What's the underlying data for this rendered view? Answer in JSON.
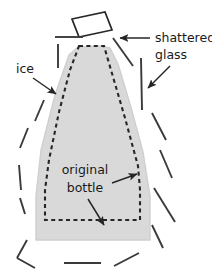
{
  "figure": {
    "background_color": "#ffffff",
    "width": 212,
    "height": 274
  },
  "colors": {
    "ice_fill": "#d9d9d9",
    "ice_edge": "#cfcfcf",
    "stroke": "#262626",
    "text": "#1a1a1a",
    "shard_stroke": "#3a3a3a"
  },
  "labels": {
    "ice": {
      "text": "ice",
      "x": 16,
      "y": 73
    },
    "shattered_glass": {
      "line1": "shattered",
      "line2": "glass",
      "x": 155,
      "y1": 42,
      "y2": 59
    },
    "original_bottle": {
      "line1": "original",
      "line2": "bottle",
      "x": 85,
      "y1": 174,
      "y2": 192
    }
  },
  "shapes": {
    "ice_block": {
      "name": "ice-block-silhouette",
      "path": "M 100 46 L 78 47 L 69 55 L 55 95 L 41 150 L 36 196 L 36 240 L 150 240 L 150 196 L 143 152 L 130 104 L 118 64 L 110 48 Z"
    },
    "original_bottle_outline": {
      "name": "original-bottle-dashed-outline",
      "path": "M 79 46 L 104 46 L 111 70 L 125 118 L 138 166 L 140 190 L 140 220 L 45 220 L 45 190 L 49 160 L 59 112 L 70 70 Z",
      "dash": "4,3.4"
    },
    "detached_neck": {
      "name": "detached-bottle-neck",
      "path": "M 72 19 L 105 12 L 112 30 L 79 37 Z"
    }
  },
  "glass_shards": [
    {
      "name": "shard-top-left-horizontal",
      "x1": 55,
      "y1": 37,
      "x2": 83,
      "y2": 37
    },
    {
      "name": "shard-upper-left-vertical",
      "x1": 58,
      "y1": 44,
      "x2": 58,
      "y2": 68
    },
    {
      "name": "shard-upper-right-diagonal",
      "x1": 113,
      "y1": 38,
      "x2": 133,
      "y2": 66
    },
    {
      "name": "shard-right-vertical",
      "x1": 141,
      "y1": 58,
      "x2": 142,
      "y2": 110
    },
    {
      "name": "shard-left-upper-diagonal",
      "x1": 44,
      "y1": 100,
      "x2": 35,
      "y2": 121
    },
    {
      "name": "shard-left-mid-diagonal",
      "x1": 28,
      "y1": 128,
      "x2": 20,
      "y2": 148
    },
    {
      "name": "shard-left-lower-vertical",
      "x1": 19,
      "y1": 165,
      "x2": 21,
      "y2": 190
    },
    {
      "name": "shard-left-bottom-short",
      "x1": 20,
      "y1": 198,
      "x2": 25,
      "y2": 214
    },
    {
      "name": "shard-right-upper-diagonal",
      "x1": 152,
      "y1": 113,
      "x2": 166,
      "y2": 140
    },
    {
      "name": "shard-right-mid-diagonal",
      "x1": 160,
      "y1": 150,
      "x2": 172,
      "y2": 178
    },
    {
      "name": "shard-right-lower-diagonal",
      "x1": 154,
      "y1": 188,
      "x2": 175,
      "y2": 222
    },
    {
      "name": "shard-right-bottom-diagonal",
      "x1": 152,
      "y1": 225,
      "x2": 163,
      "y2": 248
    },
    {
      "name": "shard-bottom-left-chevron-upper",
      "x1": 27,
      "y1": 240,
      "x2": 17,
      "y2": 258
    },
    {
      "name": "shard-bottom-left-chevron-lower",
      "x1": 17,
      "y1": 258,
      "x2": 35,
      "y2": 268
    },
    {
      "name": "shard-bottom-horizontal",
      "x1": 64,
      "y1": 263,
      "x2": 101,
      "y2": 263
    },
    {
      "name": "shard-bottom-right-diagonal",
      "x1": 114,
      "y1": 266,
      "x2": 139,
      "y2": 253
    }
  ],
  "arrows": [
    {
      "name": "arrow-ice-to-block",
      "x1": 33,
      "y1": 78,
      "x2": 56,
      "y2": 94
    },
    {
      "name": "arrow-shattered-glass-to-neck",
      "x1": 150,
      "y1": 38,
      "x2": 120,
      "y2": 38
    },
    {
      "name": "arrow-shattered-glass-to-shard",
      "x1": 170,
      "y1": 66,
      "x2": 148,
      "y2": 88
    },
    {
      "name": "arrow-original-bottle-to-side",
      "x1": 112,
      "y1": 183,
      "x2": 137,
      "y2": 174
    },
    {
      "name": "arrow-original-bottle-to-base",
      "x1": 88,
      "y1": 199,
      "x2": 104,
      "y2": 225
    }
  ]
}
